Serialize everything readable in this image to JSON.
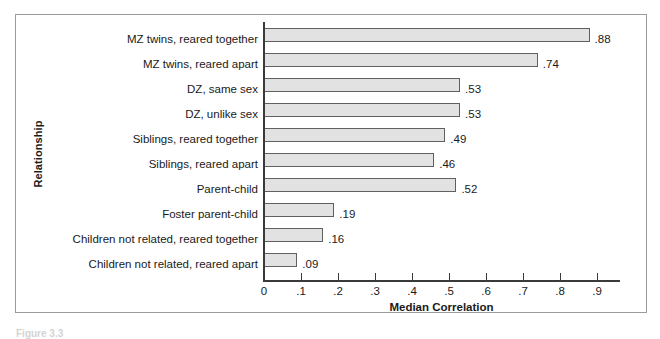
{
  "figure": {
    "caption": "Figure 3.3"
  },
  "chart_data": {
    "type": "bar",
    "orientation": "horizontal",
    "title": "",
    "xlabel": "Median Correlation",
    "ylabel": "Relationship",
    "xlim": [
      0,
      0.96
    ],
    "xticks": [
      "0",
      ".1",
      ".2",
      ".3",
      ".4",
      ".5",
      ".6",
      ".7",
      ".8",
      ".9"
    ],
    "xtick_values": [
      0,
      0.1,
      0.2,
      0.3,
      0.4,
      0.5,
      0.6,
      0.7,
      0.8,
      0.9
    ],
    "grid": false,
    "legend": null,
    "categories": [
      "MZ twins, reared together",
      "MZ twins, reared apart",
      "DZ, same sex",
      "DZ, unlike sex",
      "Siblings, reared together",
      "Siblings, reared apart",
      "Parent-child",
      "Foster parent-child",
      "Children not related, reared together",
      "Children not related, reared apart"
    ],
    "values": [
      0.88,
      0.74,
      0.53,
      0.53,
      0.49,
      0.46,
      0.52,
      0.19,
      0.16,
      0.09
    ],
    "value_labels": [
      ".88",
      ".74",
      ".53",
      ".53",
      ".49",
      ".46",
      ".52",
      ".19",
      ".16",
      ".09"
    ],
    "colors": {
      "bar_fill": "#e2e2e2",
      "bar_border": "#606060",
      "axis": "#3a3a3a",
      "frame": "#9a9a9a",
      "text": "#1a1a1a",
      "background": "#ffffff"
    }
  }
}
